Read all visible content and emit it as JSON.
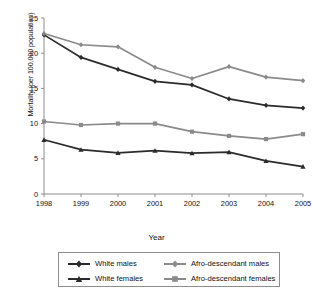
{
  "chart_data": {
    "type": "line",
    "title": "",
    "xlabel": "Year",
    "ylabel": "Mortality (per 100,000 population)",
    "x": [
      1998,
      1999,
      2000,
      2001,
      2002,
      2003,
      2004,
      2005
    ],
    "xtick_labels": [
      "1998",
      "1999",
      "2000",
      "2001",
      "2002",
      "2003",
      "2004",
      "2005"
    ],
    "ytick_labels": [
      "0",
      "5",
      "10",
      "15",
      "20",
      "25"
    ],
    "yticks": [
      0,
      5,
      10,
      15,
      20,
      25
    ],
    "ylim": [
      0,
      25
    ],
    "xlim": [
      1998,
      2005
    ],
    "grid": false,
    "legend_position": "bottom",
    "series": [
      {
        "name": "White males",
        "color": "#2b2b2b",
        "marker": "diamond",
        "values": [
          22.6,
          19.4,
          17.7,
          16.0,
          15.5,
          13.5,
          12.6,
          12.2
        ]
      },
      {
        "name": "Afro-descendant males",
        "color": "#8a8a8a",
        "marker": "diamond",
        "values": [
          22.8,
          21.2,
          20.9,
          18.0,
          16.4,
          18.1,
          16.6,
          16.1
        ]
      },
      {
        "name": "White females",
        "color": "#2b2b2b",
        "marker": "triangle",
        "values": [
          7.7,
          6.3,
          5.85,
          6.15,
          5.8,
          5.95,
          4.7,
          3.9
        ]
      },
      {
        "name": "Afro-descendant females",
        "color": "#8a8a8a",
        "marker": "square",
        "values": [
          10.3,
          9.8,
          10.0,
          10.0,
          8.85,
          8.25,
          7.8,
          8.5
        ]
      }
    ]
  },
  "legend": {
    "items": [
      {
        "label": "White males"
      },
      {
        "label": "Afro-descendant males"
      },
      {
        "label": "White females"
      },
      {
        "label": "Afro-descendant females"
      }
    ]
  }
}
